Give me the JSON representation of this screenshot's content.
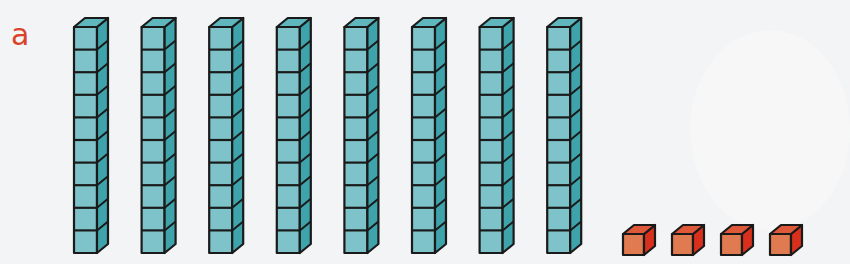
{
  "exercise": {
    "label": "a",
    "label_color": "#d9432a"
  },
  "blocks": {
    "tens_rods": {
      "count": 8,
      "cubes_per_rod": 10,
      "front_color": "#7ec3c9",
      "side_color": "#3fa3ab",
      "top_color": "#5fb6bd",
      "outline_color": "#1a1a1a"
    },
    "unit_cubes": {
      "count": 4,
      "front_color": "#e07a50",
      "side_color": "#d8301c",
      "top_color": "#e0583a",
      "outline_color": "#1a1a1a"
    }
  },
  "represented_value": 84
}
